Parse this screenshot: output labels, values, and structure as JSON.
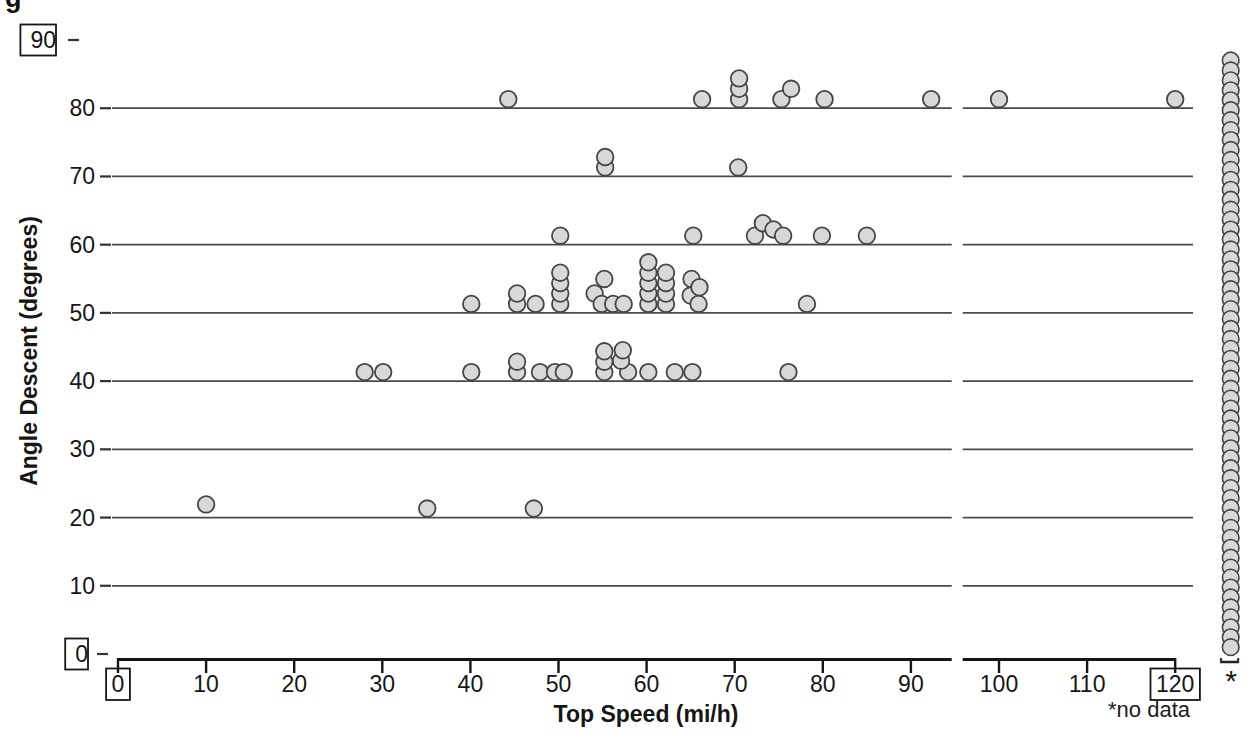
{
  "figure": {
    "corner_fragment": "g"
  },
  "chart_data": {
    "type": "scatter",
    "title": "",
    "xlabel": "Top Speed (mi/h)",
    "ylabel": "Angle Descent (degrees)",
    "xlim": [
      0,
      120
    ],
    "ylim": [
      0,
      90
    ],
    "grid_on": true,
    "x_tick_values": [
      0,
      10,
      20,
      30,
      40,
      50,
      60,
      70,
      80,
      90,
      100,
      110,
      120
    ],
    "x_boxed_ticks": [
      0,
      120
    ],
    "y_tick_values": [
      0,
      10,
      20,
      30,
      40,
      50,
      60,
      70,
      80,
      90
    ],
    "y_boxed_ticks": [
      0,
      90
    ],
    "gridline_angles": [
      10,
      20,
      30,
      40,
      50,
      60,
      70,
      80
    ],
    "axis_break_x": 95.2,
    "dot_fill": "#d8d8d8",
    "dot_stroke": "#454545",
    "gridline_color": "#4a4a4a",
    "axis_color": "#151515",
    "rows": [
      {
        "angle": 80,
        "dots": [
          {
            "x": 44.3
          },
          {
            "x": 66.3
          },
          {
            "x": 70.5
          },
          {
            "x": 70.5,
            "lift": 1
          },
          {
            "x": 70.5,
            "lift": 2
          },
          {
            "x": 75.3
          },
          {
            "x": 76.4,
            "lift": 1
          },
          {
            "x": 80.2
          },
          {
            "x": 92.3
          },
          {
            "x": 100
          },
          {
            "x": 120
          }
        ]
      },
      {
        "angle": 70,
        "dots": [
          {
            "x": 55.3
          },
          {
            "x": 55.3,
            "lift": 1
          },
          {
            "x": 70.4
          }
        ]
      },
      {
        "angle": 60,
        "dots": [
          {
            "x": 50.2
          },
          {
            "x": 65.3
          },
          {
            "x": 72.3
          },
          {
            "x": 73.2,
            "lift": 1.2
          },
          {
            "x": 74.4,
            "lift": 0.6
          },
          {
            "x": 75.5
          },
          {
            "x": 79.9
          },
          {
            "x": 85
          }
        ]
      },
      {
        "angle": 50,
        "dots": [
          {
            "x": 40.1
          },
          {
            "x": 45.3
          },
          {
            "x": 45.3,
            "lift": 1
          },
          {
            "x": 47.4
          },
          {
            "x": 50.2
          },
          {
            "x": 50.2,
            "lift": 1
          },
          {
            "x": 50.2,
            "lift": 2
          },
          {
            "x": 50.2,
            "lift": 3
          },
          {
            "x": 54.1,
            "lift": 1
          },
          {
            "x": 54.9
          },
          {
            "x": 55.2,
            "lift": 2.4
          },
          {
            "x": 56.2
          },
          {
            "x": 57.4
          },
          {
            "x": 60.2
          },
          {
            "x": 60.2,
            "lift": 1
          },
          {
            "x": 60.2,
            "lift": 2
          },
          {
            "x": 60.2,
            "lift": 3
          },
          {
            "x": 60.2,
            "lift": 4
          },
          {
            "x": 62.2
          },
          {
            "x": 62.2,
            "lift": 1
          },
          {
            "x": 62.2,
            "lift": 2
          },
          {
            "x": 62.2,
            "lift": 3
          },
          {
            "x": 65,
            "lift": 0.8
          },
          {
            "x": 65.1,
            "lift": 2.4
          },
          {
            "x": 65.9
          },
          {
            "x": 66,
            "lift": 1.6
          },
          {
            "x": 78.2
          }
        ]
      },
      {
        "angle": 40,
        "dots": [
          {
            "x": 28
          },
          {
            "x": 30.1
          },
          {
            "x": 40.1
          },
          {
            "x": 45.3
          },
          {
            "x": 45.3,
            "lift": 1
          },
          {
            "x": 47.9
          },
          {
            "x": 49.6
          },
          {
            "x": 50.6
          },
          {
            "x": 55.2
          },
          {
            "x": 55.2,
            "lift": 1
          },
          {
            "x": 55.2,
            "lift": 2
          },
          {
            "x": 57.9
          },
          {
            "x": 57.1,
            "lift": 1.1
          },
          {
            "x": 57.3,
            "lift": 2.1
          },
          {
            "x": 60.2
          },
          {
            "x": 63.2
          },
          {
            "x": 65.2
          },
          {
            "x": 76.1
          }
        ]
      },
      {
        "angle": 20,
        "dots": [
          {
            "x": 10,
            "lift": 0.4
          },
          {
            "x": 35.1
          },
          {
            "x": 47.2
          }
        ]
      }
    ],
    "no_data_column": {
      "x": 126.3,
      "count": 60,
      "angle_top": 87,
      "angle_bottom": 1,
      "bracket": "]",
      "asterisk": "*",
      "note": "*no data"
    }
  }
}
